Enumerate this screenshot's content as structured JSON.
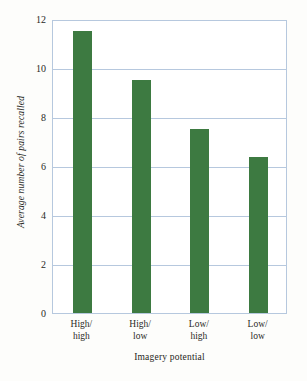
{
  "chart_data": {
    "type": "bar",
    "title": "",
    "subtitle": "",
    "categories": [
      "High/\nhigh",
      "High/\nlow",
      "Low/\nhigh",
      "Low/\nlow"
    ],
    "category_lines": [
      {
        "line1": "High/",
        "line2": "high"
      },
      {
        "line1": "High/",
        "line2": "low"
      },
      {
        "line1": "Low/",
        "line2": "high"
      },
      {
        "line1": "Low/",
        "line2": "low"
      }
    ],
    "values": [
      11.5,
      9.5,
      7.5,
      6.35
    ],
    "xlabel": "Imagery potential",
    "ylabel": "Average number of pairs recalled",
    "ylim": [
      0,
      12
    ],
    "yticks": [
      12,
      10,
      8,
      6,
      4,
      2,
      0
    ],
    "ytick_labels": [
      "12",
      "10",
      "8",
      "6",
      "4",
      "2",
      "0"
    ],
    "grid": true,
    "grid_axis": "y",
    "legend": false,
    "legend_position": "none",
    "bar_color": "#3d7a41",
    "grid_color": "#b6c8de",
    "frame_color": "#b6c8de",
    "background_color": "#fdfdfb",
    "plot_background_color": "#ffffff",
    "text_color": "#2a2a26"
  }
}
